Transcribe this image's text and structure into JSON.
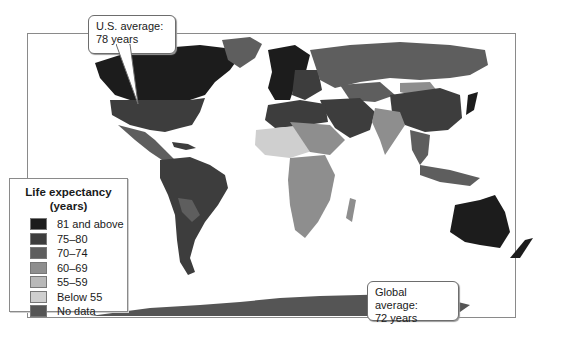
{
  "map": {
    "title": "Life expectancy world map",
    "colors": {
      "81_and_above": "#1c1c1c",
      "75_80": "#3d3d3d",
      "70_74": "#5e5e5e",
      "60_69": "#8e8e8e",
      "55_59": "#b8b8b8",
      "below_55": "#cfcfcf",
      "no_data": "#555555"
    }
  },
  "legend": {
    "title_line1": "Life expectancy",
    "title_line2": "(years)",
    "items": [
      {
        "label": "81 and above",
        "color": "#1c1c1c"
      },
      {
        "label": "75–80",
        "color": "#3d3d3d"
      },
      {
        "label": "70–74",
        "color": "#5e5e5e"
      },
      {
        "label": "60–69",
        "color": "#8e8e8e"
      },
      {
        "label": "55–59",
        "color": "#b8b8b8"
      },
      {
        "label": "Below 55",
        "color": "#cfcfcf"
      },
      {
        "label": "No data",
        "color": "#555555"
      }
    ]
  },
  "callouts": {
    "us": {
      "line1": "U.S. average:",
      "line2": "78 years"
    },
    "global": {
      "line1": "Global average:",
      "line2": "72 years"
    }
  }
}
